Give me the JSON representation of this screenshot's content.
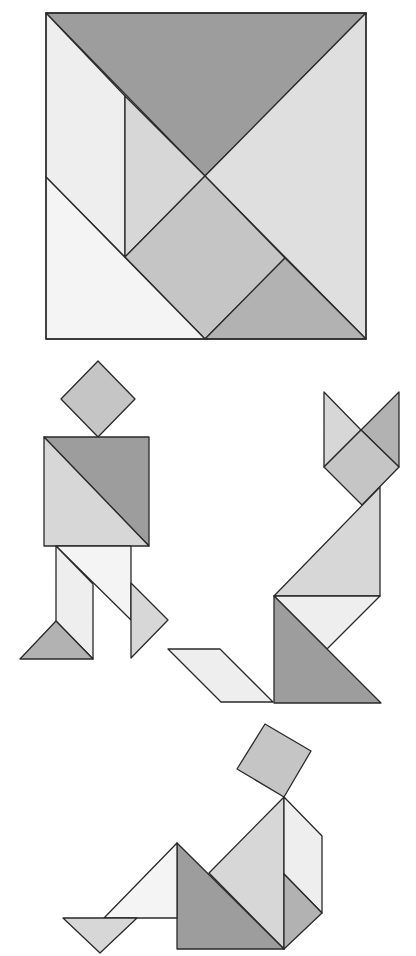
{
  "shades": {
    "dark": "#9d9d9d",
    "mid_dark": "#b2b2b2",
    "mid": "#c5c5c5",
    "mid_light": "#d7d7d7",
    "light": "#dfdfdf",
    "very_light": "#eeeeee",
    "lightest": "#f4f4f4"
  },
  "figures": [
    {
      "name": "tangram-square",
      "pieces": [
        {
          "name": "large-triangle-top",
          "shade": "dark"
        },
        {
          "name": "large-triangle-right",
          "shade": "light"
        },
        {
          "name": "parallelogram-left",
          "shade": "very_light"
        },
        {
          "name": "small-triangle-center-left",
          "shade": "mid_light"
        },
        {
          "name": "square-center",
          "shade": "mid"
        },
        {
          "name": "small-triangle-bottom-right",
          "shade": "mid_dark"
        },
        {
          "name": "medium-triangle-bottom-left",
          "shade": "lightest"
        }
      ]
    },
    {
      "name": "walking-man",
      "pieces": [
        {
          "name": "head-square",
          "shade": "mid"
        },
        {
          "name": "torso-large-triangle-dark",
          "shade": "dark"
        },
        {
          "name": "torso-large-triangle-light",
          "shade": "mid_light"
        },
        {
          "name": "right-leg-medium-triangle",
          "shade": "lightest"
        },
        {
          "name": "left-leg-parallelogram",
          "shade": "very_light"
        },
        {
          "name": "left-foot-small-triangle",
          "shade": "mid_dark"
        },
        {
          "name": "right-foot-small-triangle",
          "shade": "mid_light"
        }
      ]
    },
    {
      "name": "sitting-cat",
      "pieces": [
        {
          "name": "left-ear-small-triangle",
          "shade": "mid_light"
        },
        {
          "name": "right-ear-small-triangle",
          "shade": "mid_dark"
        },
        {
          "name": "head-square",
          "shade": "mid"
        },
        {
          "name": "body-large-triangle",
          "shade": "mid_light"
        },
        {
          "name": "chest-medium-triangle",
          "shade": "very_light"
        },
        {
          "name": "base-large-triangle",
          "shade": "dark"
        },
        {
          "name": "tail-parallelogram",
          "shade": "very_light"
        }
      ]
    },
    {
      "name": "sitting-person",
      "pieces": [
        {
          "name": "head-square",
          "shade": "mid"
        },
        {
          "name": "torso-large-triangle",
          "shade": "mid_light"
        },
        {
          "name": "back-parallelogram",
          "shade": "very_light"
        },
        {
          "name": "hip-small-triangle",
          "shade": "mid_dark"
        },
        {
          "name": "thigh-large-triangle",
          "shade": "dark"
        },
        {
          "name": "leg-medium-triangle",
          "shade": "lightest"
        },
        {
          "name": "foot-small-triangle",
          "shade": "mid_light"
        }
      ]
    }
  ]
}
